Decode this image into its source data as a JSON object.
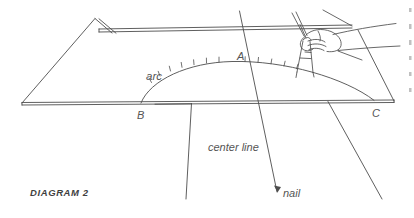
{
  "figure": {
    "caption": "DIAGRAM 2",
    "stroke_color": "#4d4d4d",
    "background_color": "#ffffff",
    "labels": {
      "point_a": "A",
      "point_b": "B",
      "point_c": "C",
      "arc": "arc",
      "center_line": "center line",
      "nail": "nail"
    },
    "parts": {
      "board": "board-in-perspective",
      "arc_curve": "struck-arc",
      "center_line_ray": "center-line-ray",
      "nail_point": "nail-pivot-point",
      "hand": "hand-holding-compass",
      "compass": "compass-dividers",
      "tick_marks": "arc-tick-marks"
    },
    "tick_count": 12,
    "edge_fragments": 6
  }
}
